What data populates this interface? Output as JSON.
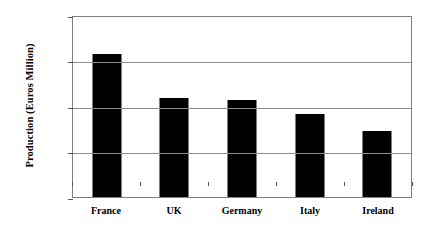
{
  "chart_data": {
    "type": "bar",
    "title": "",
    "xlabel": "",
    "ylabel": "Production (Euros Million)",
    "categories": [
      "France",
      "UK",
      "Germany",
      "Italy",
      "Ireland"
    ],
    "values": [
      31500,
      21800,
      21400,
      18200,
      14500
    ],
    "ylim": [
      0,
      40000
    ],
    "yticks": [
      0,
      10000,
      20000,
      30000,
      40000
    ],
    "ytick_labels": [
      "0",
      "10000",
      "20000",
      "30000",
      "40000"
    ],
    "grid": "horizontal",
    "legend": "none",
    "bar_color": "#000000",
    "plot_background": "#FFFFFF",
    "gridline_color": "#8C8C8C"
  }
}
